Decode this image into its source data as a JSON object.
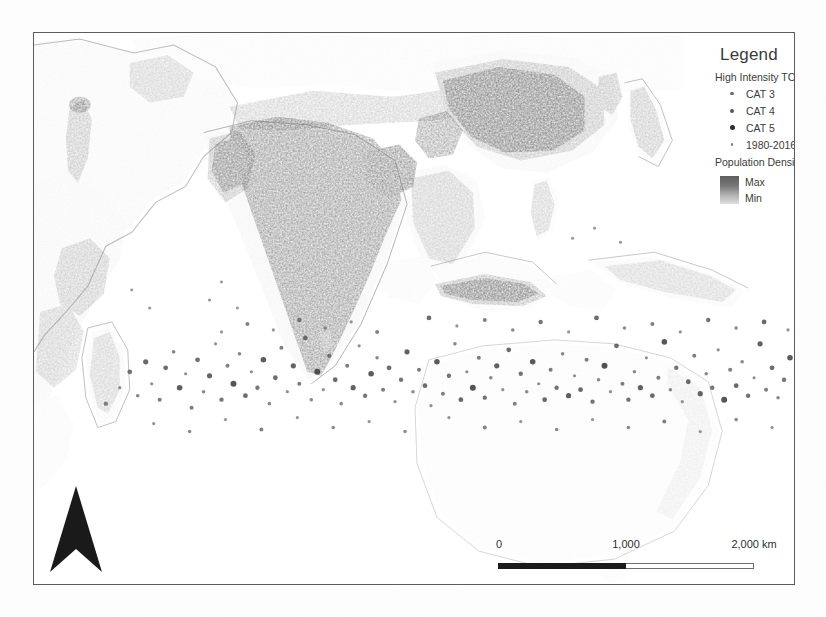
{
  "map": {
    "title": "Population Density and Tropical Cyclone Tracks",
    "frame": {
      "x": 33,
      "y": 32,
      "width": 762,
      "height": 553
    }
  },
  "legend": {
    "title": "Legend",
    "sections": [
      {
        "heading": "High Intensity TC's",
        "items": [
          {
            "label": "CAT 3",
            "symbol": "small-circle",
            "size": 3.2,
            "color": "#6b6b6b"
          },
          {
            "label": "CAT 4",
            "symbol": "medium-circle",
            "size": 4.0,
            "color": "#5a5a5a"
          },
          {
            "label": "CAT 5",
            "symbol": "large-circle",
            "size": 5.0,
            "color": "#2e2e2e"
          },
          {
            "label": "1980-2016 TC's",
            "symbol": "tiny-circle",
            "size": 2.4,
            "color": "#7d7d7d"
          }
        ]
      },
      {
        "heading": "Population Density",
        "ramp": {
          "max_label": "Max",
          "min_label": "Min",
          "max_color": "#5f5f5f",
          "min_color": "#dedede"
        }
      }
    ]
  },
  "scale_bar": {
    "labels": {
      "start": "0",
      "middle": "1,000",
      "end": "2,000 km"
    },
    "units": "km",
    "segments": [
      {
        "from": "0",
        "to": "1,000",
        "fill": "#1b1b1b"
      },
      {
        "from": "1,000",
        "to": "2,000",
        "fill": "#ffffff"
      }
    ]
  },
  "north_arrow": {
    "label": "",
    "direction": "north",
    "color": "#1a1a1a"
  },
  "map_layers": {
    "population_density": {
      "type": "raster",
      "color_min": "#f2f2f2",
      "color_max": "#3a3a3a",
      "regions_high_density": [
        "India",
        "Bangladesh",
        "Eastern China",
        "Java",
        "Japan",
        "Nile Valley",
        "Pakistan"
      ]
    },
    "cyclone_points": {
      "type": "point",
      "period": "1980-2016",
      "categories": [
        "CAT 3",
        "CAT 4",
        "CAT 5"
      ],
      "color": "#5a5a5a"
    }
  }
}
